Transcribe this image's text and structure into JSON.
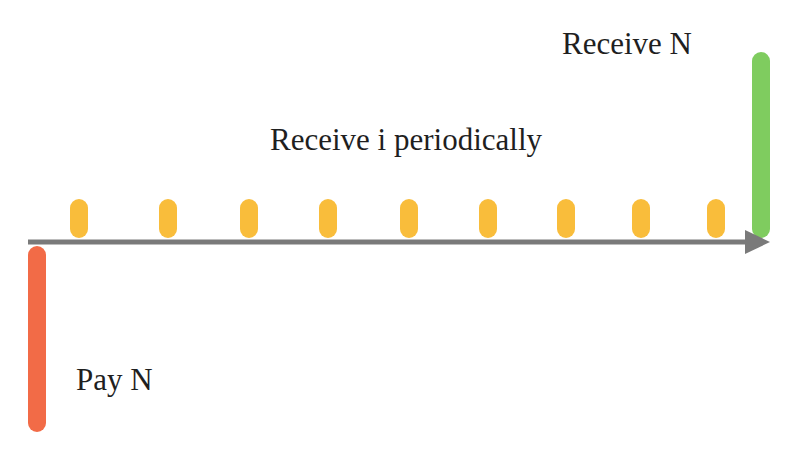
{
  "diagram": {
    "labels": {
      "receive_principal": "Receive N",
      "receive_interest": "Receive i periodically",
      "pay_principal": "Pay N"
    },
    "colors": {
      "axis": "#7a7a7a",
      "pay": "#f26b47",
      "interest": "#f9bd3b",
      "receive": "#7fcc5f",
      "text": "#1f1f1f"
    },
    "interest_payments": [
      {
        "x": 79
      },
      {
        "x": 168
      },
      {
        "x": 249
      },
      {
        "x": 328
      },
      {
        "x": 409
      },
      {
        "x": 488
      },
      {
        "x": 566
      },
      {
        "x": 641
      },
      {
        "x": 716
      }
    ],
    "interest_payment_count": 9
  }
}
